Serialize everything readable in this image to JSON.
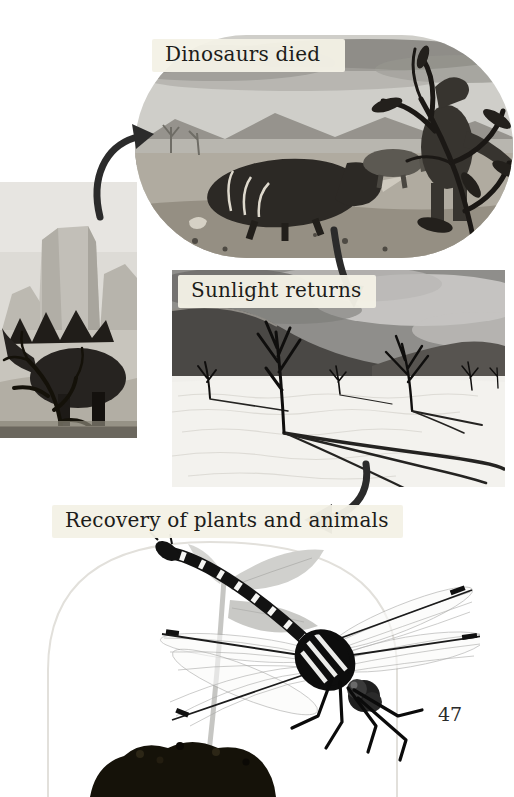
{
  "page": {
    "number": "47"
  },
  "flow": {
    "steps": [
      {
        "label": "Dinosaurs died",
        "image": "dinosaur-extinction-illustration"
      },
      {
        "label": "Sunlight returns",
        "image": "dead-trees-desert-photo"
      },
      {
        "label": "Recovery of plants and animals",
        "image": "dragonfly-on-seedling-photo"
      }
    ],
    "arrows": [
      {
        "from": "left-page-image",
        "to": "step-1"
      },
      {
        "from": "step-1",
        "to": "step-2"
      },
      {
        "from": "step-2",
        "to": "step-3"
      }
    ]
  },
  "side_image": {
    "name": "stegosaurus-illustration-cropped"
  },
  "colors": {
    "page_background": "#ffffff",
    "label_background": "#f4f1e6",
    "label_text": "#1c1c1a",
    "arrow": "#2b2b2b"
  }
}
